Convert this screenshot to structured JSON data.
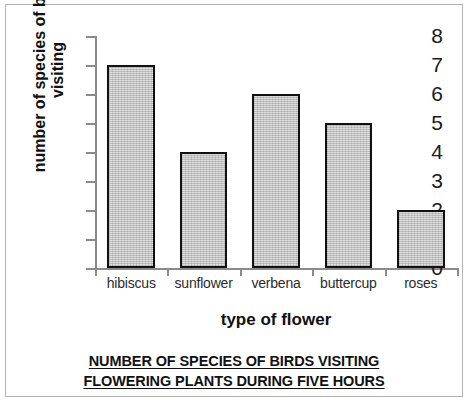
{
  "caption": {
    "line1": "NUMBER OF SPECIES OF BIRDS VISITING",
    "line2": "FLOWERING PLANTS DURING FIVE HOURS"
  },
  "axis": {
    "y_title_line1": "number of species of birds",
    "y_title_line2": "visiting",
    "x_title": "type of flower"
  },
  "chart_data": {
    "type": "bar",
    "title": "NUMBER OF SPECIES OF BIRDS VISITING FLOWERING PLANTS DURING FIVE HOURS",
    "categories": [
      "hibiscus",
      "sunflower",
      "verbena",
      "buttercup",
      "roses"
    ],
    "values": [
      7,
      4,
      6,
      5,
      2
    ],
    "xlabel": "type of flower",
    "ylabel": "number of species of birds visiting",
    "ylim": [
      0,
      8
    ],
    "yticks": [
      0,
      1,
      2,
      3,
      4,
      5,
      6,
      7,
      8
    ],
    "ytick_labels": [
      "0",
      "1",
      "2",
      "3",
      "4",
      "5",
      "6",
      "7",
      "8"
    ],
    "grid": false,
    "legend": false,
    "bar_fill_color": "#dddddd",
    "bar_edge_color": "#111111",
    "axis_color": "#8a8a8a"
  }
}
